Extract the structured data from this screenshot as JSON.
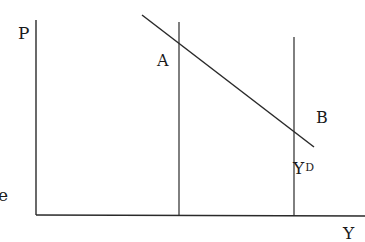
{
  "diagram": {
    "type": "economics-aggregate-demand",
    "axes": {
      "y_label": "P",
      "x_label": "Y"
    },
    "curve": {
      "label_main": "Y",
      "label_sup": "D",
      "description": "downward-sloping aggregate demand line"
    },
    "points": [
      {
        "label": "A",
        "description": "intersection of demand curve with left vertical line"
      },
      {
        "label": "B",
        "description": "intersection of demand curve with right vertical line"
      }
    ],
    "clipped_text_left": "e",
    "colors": {
      "line": "#2a2a2a",
      "text": "#1a1a1a",
      "background": "#ffffff"
    }
  }
}
